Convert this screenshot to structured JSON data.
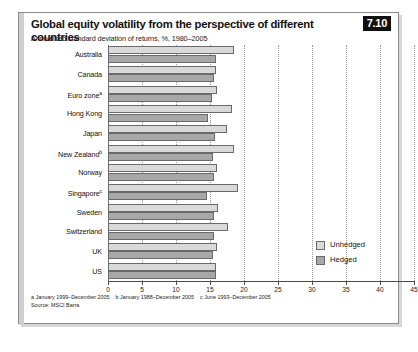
{
  "figure": {
    "number": "7.10",
    "title": "Global equity volatility from the perspective of different countries",
    "subtitle": "Annualised standard deviation of returns, %, 1980–2005",
    "source": "Source: MSCI Barra",
    "footnotes": [
      "a January 1999–December 2005",
      "b January 1988–December 2005",
      "c June 1993–December 2005"
    ]
  },
  "legend": {
    "position": "bottom-right",
    "entries": [
      {
        "label": "Unhedged",
        "color": "#d9d9d9"
      },
      {
        "label": "Hedged",
        "color": "#a8a8a8"
      }
    ]
  },
  "chart_data": {
    "type": "bar",
    "orientation": "horizontal",
    "title": "Global equity volatility from the perspective of different countries",
    "subtitle": "Annualised standard deviation of returns, %, 1980–2005",
    "xlabel": "",
    "ylabel": "",
    "xlim": [
      0,
      45
    ],
    "grid": true,
    "xticks": [
      0,
      5,
      10,
      15,
      20,
      25,
      30,
      35,
      40,
      45
    ],
    "xticklabels": [
      "0",
      "5",
      "10",
      "15",
      "20",
      "25",
      "30",
      "35",
      "40",
      "45"
    ],
    "categories": [
      "Australia",
      "Canada",
      "Euro zone",
      "Hong Kong",
      "Japan",
      "New Zealand",
      "Norway",
      "Singapore",
      "Sweden",
      "Switzerland",
      "UK",
      "US"
    ],
    "category_footnote_marks": [
      "",
      "",
      "a",
      "",
      "",
      "b",
      "",
      "c",
      "",
      "",
      "",
      ""
    ],
    "series": [
      {
        "name": "Unhedged",
        "color": "#d9d9d9",
        "values": [
          18.5,
          15.9,
          16.0,
          18.3,
          17.5,
          18.5,
          16.0,
          19.1,
          16.2,
          17.6,
          16.1,
          15.9
        ]
      },
      {
        "name": "Hedged",
        "color": "#a8a8a8",
        "values": [
          15.9,
          15.6,
          15.3,
          14.7,
          15.8,
          15.5,
          15.6,
          14.5,
          15.6,
          15.6,
          15.5,
          15.9
        ]
      }
    ]
  }
}
